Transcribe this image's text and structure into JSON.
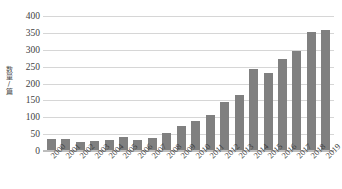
{
  "chart_data": {
    "type": "bar",
    "title": "",
    "subtitle": "",
    "xlabel": "",
    "ylabel": "数量/篇",
    "ylim": [
      0,
      400
    ],
    "ytick_values": [
      0,
      50,
      100,
      150,
      200,
      250,
      300,
      350,
      400
    ],
    "ytick_labels": [
      "0",
      "50",
      "100",
      "150",
      "200",
      "250",
      "300",
      "350",
      "400"
    ],
    "grid": true,
    "legend": false,
    "legend_position": "none",
    "bar_color": "#808080",
    "gridline_color": "#d6d6d6",
    "categories": [
      "2000",
      "2001",
      "2002",
      "2003",
      "2004",
      "2005",
      "2006",
      "2007",
      "2008",
      "2009",
      "2010",
      "2011",
      "2012",
      "2013",
      "2014",
      "2015",
      "2016",
      "2017",
      "2018",
      "2019"
    ],
    "values": [
      36,
      37,
      28,
      31,
      33,
      42,
      34,
      38,
      53,
      74,
      89,
      107,
      146,
      167,
      243,
      232,
      272,
      297,
      352,
      360
    ],
    "series": [
      {
        "name": "数量/篇",
        "values": [
          36,
          37,
          28,
          31,
          33,
          42,
          34,
          38,
          53,
          74,
          89,
          107,
          146,
          167,
          243,
          232,
          272,
          297,
          352,
          360
        ]
      }
    ]
  }
}
